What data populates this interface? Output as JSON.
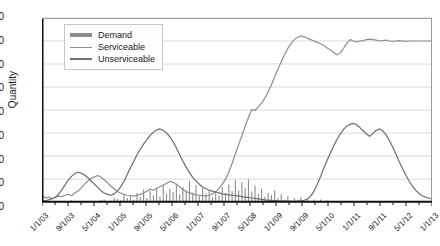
{
  "chart_data": {
    "type": "line",
    "title": "",
    "xlabel": "",
    "ylabel": "Quantity",
    "ylim": [
      0,
      800
    ],
    "yticks": [
      0,
      100,
      200,
      300,
      400,
      500,
      600,
      700,
      800
    ],
    "grid": true,
    "legend_position": "top-left",
    "x_tick_labels": [
      "1/1/03",
      "9/1/03",
      "5/1/04",
      "1/1/05",
      "9/1/05",
      "5/1/06",
      "1/1/07",
      "9/1/07",
      "5/1/08",
      "1/1/09",
      "9/1/09",
      "5/1/10",
      "1/1/11",
      "9/1/11",
      "5/1/12",
      "1/1/13"
    ],
    "x_tick_step_months": 8,
    "x_start": "1/1/03",
    "x_end": "1/1/13",
    "colors": {
      "demand": "#8c8c8c",
      "serviceable": "#8f8f8f",
      "unserviceable": "#707070",
      "axis": "#111111",
      "grid": "#d9d9d9"
    },
    "series": [
      {
        "name": "Demand",
        "style": "spikes",
        "values": [
          2,
          0,
          4,
          0,
          2,
          6,
          0,
          3,
          0,
          8,
          4,
          0,
          2,
          0,
          5,
          0,
          3,
          0,
          9,
          12,
          0,
          6,
          20,
          14,
          8,
          30,
          18,
          26,
          10,
          40,
          22,
          55,
          18,
          48,
          30,
          62,
          25,
          70,
          36,
          58,
          44,
          80,
          34,
          66,
          52,
          90,
          42,
          74,
          28,
          60,
          38,
          50,
          20,
          44,
          30,
          66,
          40,
          78,
          48,
          96,
          52,
          88,
          60,
          100,
          46,
          72,
          36,
          58,
          24,
          40,
          30,
          52,
          18,
          34,
          12,
          26,
          8,
          18,
          10,
          22,
          6,
          14,
          4,
          10,
          6,
          12,
          2,
          8,
          4,
          6,
          2,
          5,
          3,
          6,
          2,
          4,
          1,
          3,
          2,
          4,
          1,
          2,
          0,
          3,
          1,
          2,
          0,
          1,
          2,
          3,
          1,
          2,
          0,
          1,
          0,
          2,
          1,
          0,
          2,
          1
        ]
      },
      {
        "name": "Serviceable",
        "style": "line",
        "values": [
          30,
          18,
          22,
          16,
          20,
          26,
          24,
          30,
          34,
          28,
          40,
          48,
          62,
          78,
          92,
          104,
          110,
          116,
          108,
          96,
          84,
          70,
          58,
          46,
          40,
          34,
          30,
          28,
          26,
          30,
          34,
          40,
          48,
          56,
          52,
          60,
          68,
          74,
          82,
          90,
          86,
          78,
          66,
          54,
          46,
          40,
          36,
          32,
          30,
          28,
          26,
          30,
          36,
          46,
          60,
          78,
          100,
          130,
          168,
          210,
          250,
          290,
          330,
          368,
          402,
          398,
          414,
          430,
          452,
          478,
          510,
          545,
          578,
          610,
          640,
          668,
          690,
          706,
          716,
          722,
          718,
          712,
          706,
          700,
          694,
          688,
          680,
          670,
          662,
          650,
          640,
          648,
          668,
          690,
          706,
          700,
          696,
          700,
          702,
          706,
          708,
          706,
          704,
          700,
          702,
          704,
          700,
          698,
          700,
          702,
          700,
          698,
          700,
          700,
          700,
          700,
          700,
          700,
          700,
          700
        ]
      },
      {
        "name": "Unserviceable",
        "style": "line",
        "values": [
          8,
          6,
          10,
          14,
          20,
          34,
          52,
          74,
          96,
          112,
          124,
          130,
          126,
          118,
          106,
          92,
          78,
          64,
          50,
          40,
          34,
          30,
          36,
          48,
          66,
          90,
          120,
          150,
          178,
          206,
          230,
          252,
          272,
          290,
          304,
          314,
          318,
          312,
          300,
          284,
          262,
          236,
          206,
          178,
          152,
          128,
          108,
          92,
          78,
          66,
          58,
          52,
          48,
          44,
          40,
          36,
          34,
          32,
          30,
          28,
          26,
          24,
          22,
          20,
          18,
          16,
          14,
          12,
          10,
          9,
          8,
          7,
          6,
          6,
          5,
          5,
          4,
          4,
          5,
          6,
          8,
          14,
          26,
          48,
          78,
          112,
          148,
          182,
          214,
          244,
          272,
          296,
          316,
          330,
          338,
          342,
          336,
          324,
          310,
          296,
          286,
          300,
          312,
          318,
          310,
          292,
          268,
          240,
          208,
          176,
          146,
          118,
          92,
          70,
          52,
          38,
          28,
          22,
          18,
          14
        ]
      }
    ]
  },
  "legend": {
    "items": [
      {
        "label": "Demand"
      },
      {
        "label": "Serviceable"
      },
      {
        "label": "Unserviceable"
      }
    ]
  }
}
